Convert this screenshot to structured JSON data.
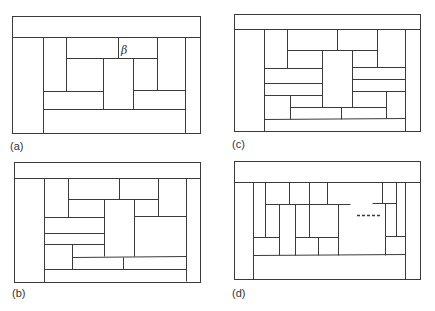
{
  "figure": {
    "panels": [
      {
        "id": "a",
        "label": "(a)",
        "annotation": "β"
      },
      {
        "id": "b",
        "label": "(b)"
      },
      {
        "id": "c",
        "label": "(c)"
      },
      {
        "id": "d",
        "label": "(d)",
        "annotation": "----"
      }
    ]
  }
}
